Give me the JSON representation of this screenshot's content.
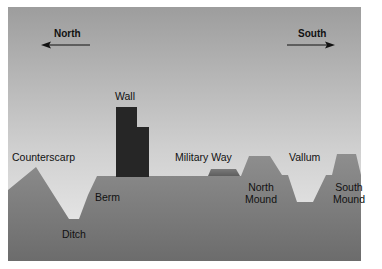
{
  "diagram": {
    "directions": {
      "north": {
        "label": "North",
        "arrow": "left"
      },
      "south": {
        "label": "South",
        "arrow": "right"
      }
    },
    "features": {
      "wall": "Wall",
      "counterscarp": "Counterscarp",
      "ditch": "Ditch",
      "berm": "Berm",
      "military_way": "Military Way",
      "vallum": "Vallum",
      "north_mound_line1": "North",
      "north_mound_line2": "Mound",
      "south_mound_line1": "South",
      "south_mound_line2": "Mound"
    },
    "colors": {
      "sky_top": "#9d9d9d",
      "sky_horizon": "#ececec",
      "ground_top": "#8c8c8c",
      "ground_bottom": "#6e6e6e",
      "wall": "#262626",
      "military_way": "#686868",
      "frame_bg": "#ffffff"
    }
  }
}
